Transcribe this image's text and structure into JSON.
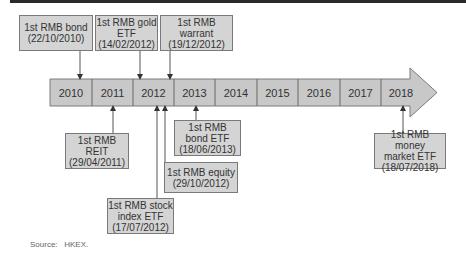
{
  "timeline": {
    "years": [
      "2010",
      "2011",
      "2012",
      "2013",
      "2014",
      "2015",
      "2016",
      "2017",
      "2018"
    ],
    "colors": {
      "bar_fill": "#c8c8c8",
      "box_fill": "#d4d4d4",
      "border": "#7a7a7a",
      "text": "#333333"
    }
  },
  "events_above": [
    {
      "line1": "1st RMB bond",
      "line2": "",
      "line3": "(22/10/2010)"
    },
    {
      "line1": "1st RMB gold",
      "line2": "ETF",
      "line3": "(14/02/2012)"
    },
    {
      "line1": "1st RMB",
      "line2": "warrant",
      "line3": "(19/12/2012)"
    }
  ],
  "events_below": [
    {
      "line1": "1st RMB",
      "line2": "REIT",
      "line3": "(29/04/2011)"
    },
    {
      "line1": "1st RMB stock",
      "line2": "index ETF",
      "line3": "(17/07/2012)"
    },
    {
      "line1": "1st RMB equity",
      "line2": "",
      "line3": "(29/10/2012)"
    },
    {
      "line1": "1st RMB",
      "line2": "bond ETF",
      "line3": "(18/06/2013)"
    },
    {
      "line1": "1st RMB money",
      "line2": "market ETF",
      "line3": "(18/07/2018)"
    }
  ],
  "source": {
    "label": "Source:",
    "value": "HKEX."
  }
}
